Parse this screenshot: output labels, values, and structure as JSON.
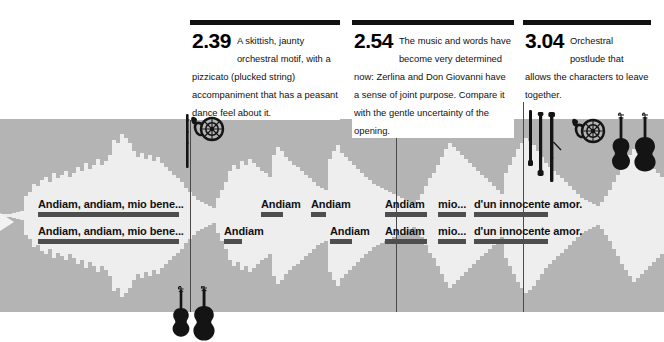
{
  "figure": {
    "background_color": "#ffffff",
    "band_color": "#b4b4b4",
    "wave_color": "#eeeeee",
    "bar_color": "#4e4e4e",
    "rule_color": "#111111"
  },
  "callouts": [
    {
      "time": "2.39",
      "text": "A skittish, jaunty orchestral motif, with a pizzicato (plucked string) accompaniment that has a peasant dance feel about it."
    },
    {
      "time": "2.54",
      "text": "The music and words have become very determined now: Zerlina and Don Giovanni have a sense of joint purpose. Compare it with the gentle uncertainty of the opening."
    },
    {
      "time": "3.04",
      "text": "Orchestral postlude that allows the characters to leave together."
    }
  ],
  "lyrics": {
    "upper": [
      "Andiam, andiam, mio bene...",
      "Andiam",
      "Andiam",
      "Andiam",
      "mio...",
      "d'un innocente amor."
    ],
    "lower": [
      "Andiam, andiam, mio bene...",
      "Andiam",
      "Andiam",
      "Andiam",
      "mio...",
      "d'un innocente amor."
    ]
  },
  "instruments": {
    "top_left_group": [
      "flute-icon",
      "french-horn-icon"
    ],
    "top_right_group": [
      "clarinet-icon",
      "oboe-icon",
      "bassoon-icon",
      "french-horn-icon",
      "violin-icon",
      "cello-icon"
    ],
    "bottom_group": [
      "violin-icon",
      "cello-icon"
    ]
  },
  "markers": {
    "left_playhead": "playhead-arrow"
  },
  "chart_data": {
    "type": "area",
    "xlabel": "time",
    "ylabel": "amplitude",
    "x": [
      0,
      4,
      8,
      12,
      16,
      20,
      24,
      28,
      32,
      36,
      40,
      44,
      48,
      52,
      56,
      60,
      64,
      68,
      72,
      76,
      80,
      84,
      88,
      92,
      96,
      100,
      104,
      108,
      112,
      116,
      120,
      124,
      128,
      132,
      136,
      140,
      144,
      148,
      152,
      156,
      160,
      164,
      168,
      172,
      176,
      180,
      184,
      188,
      192,
      196,
      200,
      204,
      208,
      212,
      216,
      220,
      224,
      228,
      232,
      236,
      240,
      244,
      248,
      252,
      256,
      260,
      264,
      268,
      272,
      276,
      280,
      284,
      288,
      292,
      296,
      300,
      304,
      308,
      312,
      316,
      320,
      324,
      328,
      332,
      336,
      340,
      344,
      348,
      352,
      356,
      360,
      364,
      368,
      372,
      376,
      380,
      384,
      388,
      392,
      396,
      400,
      404,
      408,
      412,
      416,
      420,
      424,
      428,
      432,
      436,
      440,
      444,
      448,
      452,
      456,
      460,
      464,
      468,
      472,
      476,
      480,
      484,
      488,
      492,
      496,
      500,
      504,
      508,
      512,
      516,
      520,
      524,
      528,
      532,
      536,
      540,
      544,
      548,
      552,
      556,
      560,
      564,
      568,
      572,
      576,
      580,
      584,
      588,
      592,
      596,
      600,
      604,
      608,
      612,
      616,
      620,
      624,
      628,
      632,
      636,
      640,
      644,
      648,
      652,
      656,
      660
    ],
    "values": [
      2,
      2,
      2,
      3,
      4,
      5,
      20,
      24,
      32,
      30,
      36,
      40,
      34,
      44,
      38,
      42,
      46,
      40,
      44,
      50,
      46,
      54,
      48,
      52,
      58,
      52,
      56,
      62,
      78,
      74,
      84,
      80,
      74,
      66,
      60,
      64,
      58,
      62,
      56,
      60,
      54,
      50,
      46,
      42,
      38,
      34,
      28,
      24,
      20,
      16,
      14,
      12,
      10,
      8,
      18,
      26,
      34,
      46,
      52,
      48,
      56,
      52,
      58,
      54,
      50,
      46,
      44,
      40,
      62,
      70,
      66,
      60,
      56,
      52,
      50,
      46,
      42,
      38,
      34,
      30,
      28,
      26,
      58,
      66,
      72,
      64,
      60,
      56,
      52,
      48,
      44,
      40,
      36,
      32,
      30,
      28,
      26,
      24,
      22,
      20,
      18,
      16,
      14,
      12,
      16,
      22,
      30,
      38,
      44,
      52,
      60,
      68,
      74,
      70,
      66,
      62,
      58,
      54,
      50,
      46,
      42,
      38,
      34,
      30,
      26,
      22,
      44,
      52,
      60,
      68,
      74,
      80,
      76,
      72,
      66,
      60,
      54,
      50,
      46,
      42,
      38,
      34,
      30,
      26,
      22,
      18,
      16,
      14,
      12,
      10,
      14,
      20,
      26,
      34,
      42,
      50,
      56,
      62,
      68,
      64,
      60,
      56,
      52,
      48,
      44,
      40
    ],
    "ylim": [
      0,
      96
    ],
    "grid": false,
    "legend": false
  }
}
